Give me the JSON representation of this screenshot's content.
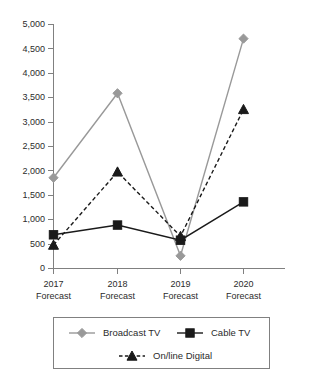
{
  "chart_data": {
    "type": "line",
    "title": "",
    "xlabel": "",
    "ylabel": "",
    "ylim": [
      0,
      5000
    ],
    "grid": false,
    "legend_position": "bottom",
    "categories": [
      "2017 Forecast",
      "2018 Forecast",
      "2019 Forecast",
      "2020 Forecast"
    ],
    "category_lines": [
      [
        "2017",
        "Forecast"
      ],
      [
        "2018",
        "Forecast"
      ],
      [
        "2019",
        "Forecast"
      ],
      [
        "2020",
        "Forecast"
      ]
    ],
    "ytick_labels": [
      "0",
      "500",
      "1,000",
      "1,500",
      "2,000",
      "2,500",
      "3,000",
      "3,500",
      "4,000",
      "4,500",
      "5,000"
    ],
    "ytick_values": [
      0,
      500,
      1000,
      1500,
      2000,
      2500,
      3000,
      3500,
      4000,
      4500,
      5000
    ],
    "series": [
      {
        "name": "Broadcast TV",
        "values": [
          1850,
          3580,
          250,
          4700
        ],
        "color": "#999999",
        "marker": "diamond",
        "line_style": "solid"
      },
      {
        "name": "Cable TV",
        "values": [
          680,
          880,
          570,
          1355
        ],
        "color": "#1a1a1a",
        "marker": "square",
        "line_style": "solid"
      },
      {
        "name": "On/line Digital",
        "values": [
          470,
          1970,
          650,
          3250
        ],
        "color": "#1a1a1a",
        "marker": "triangle",
        "line_style": "dashed"
      }
    ]
  },
  "legend": {
    "entries": [
      {
        "label": "Broadcast TV"
      },
      {
        "label": "Cable TV"
      },
      {
        "label": "On/line Digital"
      }
    ]
  }
}
